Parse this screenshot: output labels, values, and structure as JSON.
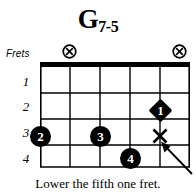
{
  "title": {
    "root": "G",
    "suffix": "7-5",
    "full": "G7-5"
  },
  "labels": {
    "frets": "Frets"
  },
  "fret_numbers": [
    "1",
    "2",
    "3",
    "4"
  ],
  "caption": "Lower the fifth one fret.",
  "colors": {
    "ink": "#000000",
    "paper": "#ffffff"
  },
  "diagram": {
    "strings": 6,
    "frets": 4,
    "nut": true,
    "string_markers": [
      {
        "icon": "circled-x-icon",
        "string": 2,
        "symbol": "muted-or-optional"
      },
      {
        "icon": "circled-x-icon",
        "string": 6,
        "symbol": "muted-or-optional"
      }
    ],
    "fingerings": [
      {
        "finger": "2",
        "string": 1,
        "fret": 3,
        "shape": "circle"
      },
      {
        "finger": "3",
        "string": 3,
        "fret": 3,
        "shape": "circle"
      },
      {
        "finger": "1",
        "string": 5,
        "fret": 2,
        "shape": "diamond"
      },
      {
        "finger": "4",
        "string": 4,
        "fret": 4,
        "shape": "circle"
      }
    ],
    "board_marks": [
      {
        "icon": "x-mark-icon",
        "string": 5,
        "fret": 3
      }
    ],
    "annotation_arrow": {
      "icon": "arrow-up-left-icon",
      "points_to": "x-mark-icon"
    }
  }
}
